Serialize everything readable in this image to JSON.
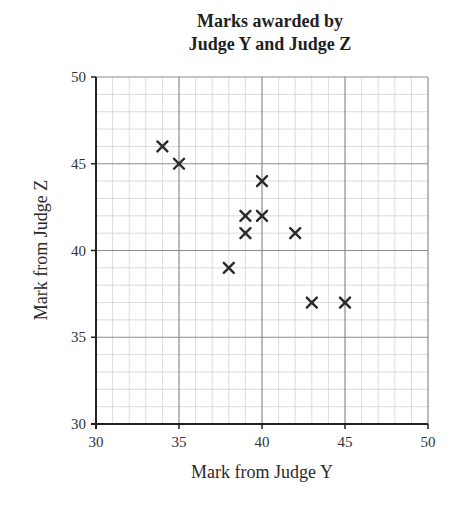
{
  "chart_data": {
    "type": "scatter",
    "title_lines": [
      "Marks awarded by",
      "Judge Y and Judge Z"
    ],
    "xlabel": "Mark from Judge Y",
    "ylabel": "Mark from Judge Z",
    "xlim": [
      30,
      50
    ],
    "ylim": [
      30,
      50
    ],
    "xticks": [
      30,
      35,
      40,
      45,
      50
    ],
    "yticks": [
      30,
      35,
      40,
      45,
      50
    ],
    "minor_grid_step": 1,
    "grid": true,
    "marker": "x",
    "points": [
      {
        "x": 34,
        "y": 46
      },
      {
        "x": 35,
        "y": 45
      },
      {
        "x": 38,
        "y": 39
      },
      {
        "x": 39,
        "y": 42
      },
      {
        "x": 39,
        "y": 41
      },
      {
        "x": 40,
        "y": 44
      },
      {
        "x": 40,
        "y": 42
      },
      {
        "x": 42,
        "y": 41
      },
      {
        "x": 43,
        "y": 37
      },
      {
        "x": 45,
        "y": 37
      }
    ],
    "x": [
      34,
      35,
      38,
      39,
      39,
      40,
      40,
      42,
      43,
      45
    ],
    "y": [
      46,
      45,
      39,
      42,
      41,
      44,
      42,
      41,
      37,
      37
    ]
  },
  "colors": {
    "axis": "#222222",
    "major_grid": "#8c8c8c",
    "minor_grid": "#d2d2d2",
    "marker": "#2a2a2a"
  }
}
